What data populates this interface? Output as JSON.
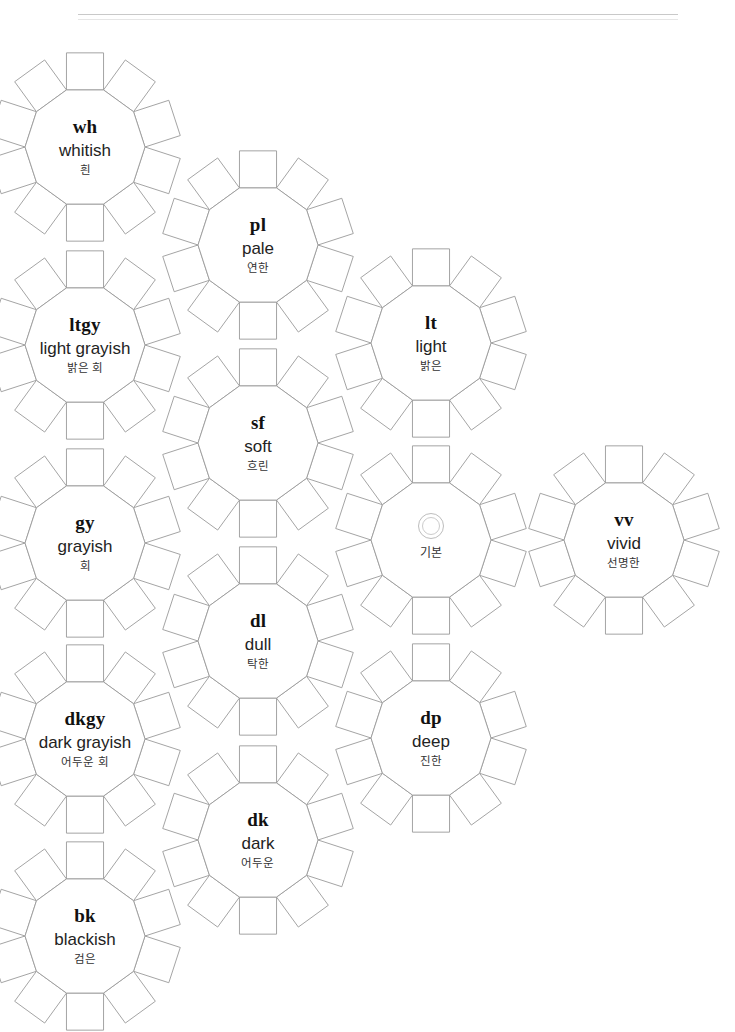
{
  "page": {
    "corner_mark": "",
    "background_color": "#ffffff",
    "stroke_color": "#9a9a9a"
  },
  "diagram": {
    "title": "",
    "core_sides": 10,
    "petals_per_cluster": 10,
    "clusters": [
      {
        "id": "wh",
        "abbr": "wh",
        "en": "whitish",
        "ko": "흰",
        "cx": 85,
        "cy": 147,
        "r": 60,
        "type": "tone"
      },
      {
        "id": "pl",
        "abbr": "pl",
        "en": "pale",
        "ko": "연한",
        "cx": 258,
        "cy": 245,
        "r": 60,
        "type": "tone"
      },
      {
        "id": "ltgy",
        "abbr": "ltgy",
        "en": "light grayish",
        "ko": "밝은 회",
        "cx": 85,
        "cy": 345,
        "r": 60,
        "type": "tone"
      },
      {
        "id": "lt",
        "abbr": "lt",
        "en": "light",
        "ko": "밝은",
        "cx": 431,
        "cy": 343,
        "r": 60,
        "type": "tone"
      },
      {
        "id": "sf",
        "abbr": "sf",
        "en": "soft",
        "ko": "흐린",
        "cx": 258,
        "cy": 443,
        "r": 60,
        "type": "tone"
      },
      {
        "id": "gy",
        "abbr": "gy",
        "en": "grayish",
        "ko": "회",
        "cx": 85,
        "cy": 543,
        "r": 60,
        "type": "tone"
      },
      {
        "id": "neutral",
        "abbr": "",
        "en": "",
        "ko": "기본",
        "cx": 431,
        "cy": 540,
        "r": 60,
        "type": "neutral",
        "icon": "double-ring-icon"
      },
      {
        "id": "vv",
        "abbr": "vv",
        "en": "vivid",
        "ko": "선명한",
        "cx": 624,
        "cy": 540,
        "r": 60,
        "type": "tone"
      },
      {
        "id": "dl",
        "abbr": "dl",
        "en": "dull",
        "ko": "탁한",
        "cx": 258,
        "cy": 641,
        "r": 60,
        "type": "tone"
      },
      {
        "id": "dkgy",
        "abbr": "dkgy",
        "en": "dark grayish",
        "ko": "어두운 회",
        "cx": 85,
        "cy": 739,
        "r": 60,
        "type": "tone"
      },
      {
        "id": "dp",
        "abbr": "dp",
        "en": "deep",
        "ko": "진한",
        "cx": 431,
        "cy": 738,
        "r": 60,
        "type": "tone"
      },
      {
        "id": "dk",
        "abbr": "dk",
        "en": "dark",
        "ko": "어두운",
        "cx": 258,
        "cy": 840,
        "r": 60,
        "type": "tone"
      },
      {
        "id": "bk",
        "abbr": "bk",
        "en": "blackish",
        "ko": "검은",
        "cx": 85,
        "cy": 936,
        "r": 60,
        "type": "tone"
      }
    ]
  }
}
